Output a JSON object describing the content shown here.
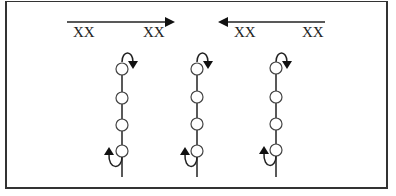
{
  "diagram": {
    "top_arrows": [
      {
        "direction": "right",
        "labels": [
          "XX",
          "XX"
        ]
      },
      {
        "direction": "left",
        "labels": [
          "XX",
          "XX"
        ]
      }
    ],
    "chains": [
      {
        "nodes": 4,
        "top_arrow": "down",
        "bottom_arrow": "up"
      },
      {
        "nodes": 4,
        "top_arrow": "down",
        "bottom_arrow": "up"
      },
      {
        "nodes": 4,
        "top_arrow": "down",
        "bottom_arrow": "up"
      }
    ],
    "colors": {
      "stroke": "#222222",
      "background": "#ffffff",
      "frame": "#333333"
    }
  }
}
